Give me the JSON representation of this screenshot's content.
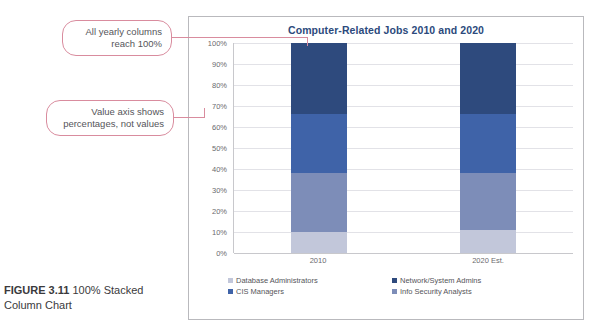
{
  "caption": {
    "figure_label": "FIGURE 3.11",
    "text": "100% Stacked Column Chart"
  },
  "callouts": [
    {
      "id": "callout-1",
      "text": "All yearly columns reach 100%"
    },
    {
      "id": "callout-2",
      "text": "Value axis shows percentages, not values"
    }
  ],
  "colors": {
    "accent_callout_border": "#d98c9e",
    "title": "#2c4a7c",
    "series_database_administrators": "#c2c7da",
    "series_info_security_analysts": "#7d8db8",
    "series_cis_managers": "#3f63a8",
    "series_network_system_admins": "#2e4a7d",
    "gridline": "#e2e2e7",
    "frame_border": "#b9b9bd"
  },
  "chart_data": {
    "type": "bar",
    "stacked": "100%",
    "title": "Computer-Related Jobs 2010 and 2020",
    "xlabel": "",
    "ylabel": "",
    "ylim": [
      0,
      100
    ],
    "grid": true,
    "legend_position": "bottom",
    "categories": [
      "2010",
      "2020 Est."
    ],
    "tick_labels": [
      "0%",
      "10%",
      "20%",
      "30%",
      "40%",
      "50%",
      "60%",
      "70%",
      "80%",
      "90%",
      "100%"
    ],
    "tick_values": [
      0,
      10,
      20,
      30,
      40,
      50,
      60,
      70,
      80,
      90,
      100
    ],
    "series": [
      {
        "name": "Database Administrators",
        "color": "#c2c7da",
        "values": [
          10,
          11
        ]
      },
      {
        "name": "Info Security Analysts",
        "color": "#7d8db8",
        "values": [
          28,
          27
        ]
      },
      {
        "name": "CIS Managers",
        "color": "#3f63a8",
        "values": [
          28,
          28
        ]
      },
      {
        "name": "Network/System Admins",
        "color": "#2e4a7d",
        "values": [
          34,
          34
        ]
      }
    ]
  }
}
